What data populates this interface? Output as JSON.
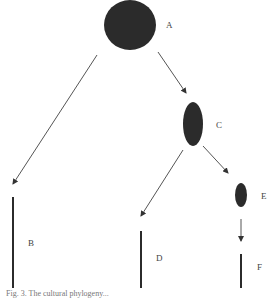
{
  "diagram": {
    "colors": {
      "node": "#2b2b2b",
      "edge": "#555555",
      "label": "#444444"
    },
    "nodes": [
      {
        "id": "A",
        "label": "A",
        "shape": "ellipse",
        "cx": 130,
        "cy": 25,
        "rx": 26,
        "ry": 25,
        "lx": 166,
        "ly": 28
      },
      {
        "id": "C",
        "label": "C",
        "shape": "ellipse",
        "cx": 193,
        "cy": 124,
        "rx": 10,
        "ry": 22,
        "lx": 216,
        "ly": 128
      },
      {
        "id": "E",
        "label": "E",
        "shape": "ellipse",
        "cx": 241,
        "cy": 195,
        "rx": 6,
        "ry": 12,
        "lx": 261,
        "ly": 199
      },
      {
        "id": "B",
        "label": "B",
        "shape": "bar",
        "x": 13,
        "y1": 197,
        "y2": 288,
        "lx": 28,
        "ly": 246
      },
      {
        "id": "D",
        "label": "D",
        "shape": "bar",
        "x": 141,
        "y1": 231,
        "y2": 288,
        "lx": 156,
        "ly": 261
      },
      {
        "id": "F",
        "label": "F",
        "shape": "bar",
        "x": 241,
        "y1": 254,
        "y2": 288,
        "lx": 257,
        "ly": 270
      }
    ],
    "edges": [
      {
        "from": "A",
        "to": "B",
        "x1": 97,
        "y1": 55,
        "x2": 13,
        "y2": 184
      },
      {
        "from": "A",
        "to": "C",
        "x1": 158,
        "y1": 52,
        "x2": 186,
        "y2": 93
      },
      {
        "from": "C",
        "to": "D",
        "x1": 183,
        "y1": 150,
        "x2": 141,
        "y2": 216
      },
      {
        "from": "C",
        "to": "E",
        "x1": 203,
        "y1": 146,
        "x2": 228,
        "y2": 173
      },
      {
        "from": "E",
        "to": "F",
        "x1": 241,
        "y1": 219,
        "x2": 241,
        "y2": 241
      }
    ],
    "caption": "Fig. 3. The cultural phylogeny..."
  }
}
